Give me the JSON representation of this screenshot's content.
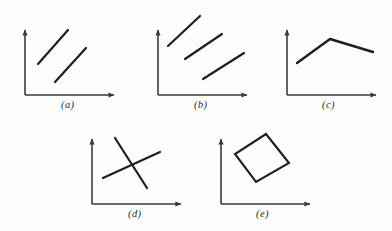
{
  "figure": {
    "background_color": "#fdfdfc",
    "ink_color": "#1e1e1e",
    "axis_color": "#3a3a3a",
    "panel_count": 5
  },
  "panels": [
    {
      "id": "a",
      "caption": "(a)",
      "caption_x": 61,
      "caption_y": 99,
      "axes": {
        "origin_x": 25,
        "origin_y": 95,
        "x_axis_end_x": 117,
        "y_axis_top_y": 27,
        "x_label": "",
        "y_label": ""
      },
      "marks": [
        {
          "name": "upper-segment",
          "x1": 38,
          "y1": 64,
          "x2": 68,
          "y2": 30
        },
        {
          "name": "lower-segment",
          "x1": 55,
          "y1": 82,
          "x2": 86,
          "y2": 48
        }
      ]
    },
    {
      "id": "b",
      "caption": "(b)",
      "caption_x": 194,
      "caption_y": 99,
      "axes": {
        "origin_x": 158,
        "origin_y": 95,
        "x_axis_end_x": 250,
        "y_axis_top_y": 27,
        "x_label": "",
        "y_label": ""
      },
      "marks": [
        {
          "name": "upper-segment",
          "x1": 168,
          "y1": 46,
          "x2": 200,
          "y2": 16
        },
        {
          "name": "middle-segment",
          "x1": 185,
          "y1": 59,
          "x2": 222,
          "y2": 34
        },
        {
          "name": "lower-segment",
          "x1": 203,
          "y1": 79,
          "x2": 244,
          "y2": 53
        }
      ]
    },
    {
      "id": "c",
      "caption": "(c)",
      "caption_x": 322,
      "caption_y": 99,
      "axes": {
        "origin_x": 287,
        "origin_y": 95,
        "x_axis_end_x": 379,
        "y_axis_top_y": 27,
        "x_label": "",
        "y_label": ""
      },
      "marks": [
        {
          "name": "peak-polyline",
          "points": "297,63 330,39 373,52"
        }
      ]
    },
    {
      "id": "d",
      "caption": "(d)",
      "caption_x": 128,
      "caption_y": 208,
      "axes": {
        "origin_x": 92,
        "origin_y": 204,
        "x_axis_end_x": 184,
        "y_axis_top_y": 136,
        "x_label": "",
        "y_label": ""
      },
      "marks": [
        {
          "name": "descending-segment",
          "x1": 115,
          "y1": 138,
          "x2": 147,
          "y2": 188
        },
        {
          "name": "ascending-segment",
          "x1": 103,
          "y1": 178,
          "x2": 160,
          "y2": 152
        }
      ]
    },
    {
      "id": "e",
      "caption": "(e)",
      "caption_x": 256,
      "caption_y": 208,
      "axes": {
        "origin_x": 221,
        "origin_y": 204,
        "x_axis_end_x": 313,
        "y_axis_top_y": 136,
        "x_label": "",
        "y_label": ""
      },
      "marks": [
        {
          "name": "closed-quadrilateral",
          "points": "266,134 289,163 256,182 235,154"
        }
      ]
    }
  ]
}
